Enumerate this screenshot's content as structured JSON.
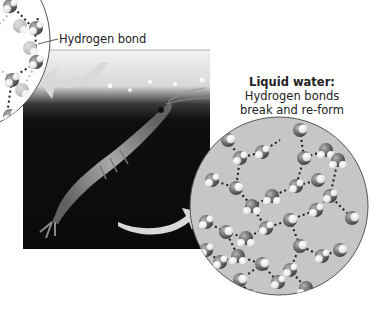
{
  "figure": {
    "labels": {
      "hydrogen_bond": "Hydrogen bond",
      "liquid_title": "Liquid water:",
      "liquid_line1": "Hydrogen bonds",
      "liquid_line2": "break and re-form"
    },
    "panels": {
      "ice_inset": {
        "description": "Magnified ice lattice of water molecules with regular hydrogen bonds (partially cropped, top-left)"
      },
      "photo": {
        "description": "Grayscale photograph of a krill swimming beneath sea ice"
      },
      "liquid_inset": {
        "description": "Magnified liquid water with irregular hydrogen bonds between molecules"
      }
    },
    "arrows": [
      {
        "from": "photo",
        "to": "ice_inset"
      },
      {
        "from": "photo",
        "to": "liquid_inset"
      }
    ],
    "colors": {
      "background": "#ffffff",
      "photo_dark": "#0e0e0e",
      "circle_fill": "#c4c4c4",
      "oxygen": "#6e6e6e",
      "hydrogen": "#f2f2f2",
      "bond_dots": "#1a1a1a",
      "arrow": "#d6d6d6"
    }
  }
}
